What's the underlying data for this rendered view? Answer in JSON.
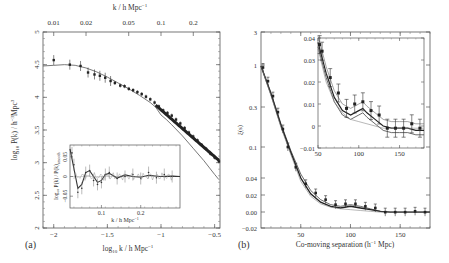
{
  "figure": {
    "panels": [
      {
        "id": "a",
        "label": "(a)",
        "xlabel": "log10 k / h Mpc^-1",
        "xlabel_main": "log",
        "xlabel_sub": "10",
        "xlabel_rest": " k / h Mpc",
        "xlabel_sup": "−1",
        "ylabel_main": "log",
        "ylabel_sub": "10",
        "ylabel_rest": " P(k) / h",
        "ylabel_sup": "−3",
        "ylabel_tail": "Mpc",
        "ylabel_sup2": "3",
        "top_axis_label": "k / h Mpc",
        "top_axis_sup": "−1",
        "top_ticks": [
          "0.01",
          "0.02",
          "0.05",
          "0.1",
          "0.2"
        ],
        "x_ticks": [
          "−2",
          "−1.5",
          "−1",
          "−0.5"
        ],
        "y_ticks": [
          "2",
          "2.5",
          "3",
          "3.5",
          "4",
          "4.5",
          "5"
        ],
        "inset": {
          "xlabel": "k / h Mpc",
          "xlabel_sup": "−1",
          "ylabel": "log10 P(k) / P(k)smooth",
          "ylabel_text": "log₁₀ P(k) / P(k)",
          "ylabel_sub": "smooth",
          "x_ticks": [
            "0.1",
            "0.2"
          ],
          "y_ticks": [
            "0.05",
            "0",
            "−0.05"
          ]
        }
      },
      {
        "id": "b",
        "label": "(b)",
        "xlabel": "Co-moving separation (h^-1 Mpc)",
        "xlabel_pre": "Co-moving separation (h",
        "xlabel_sup": "−1",
        "xlabel_post": " Mpc)",
        "ylabel": "ξ(s)",
        "x_ticks": [
          "50",
          "100",
          "150"
        ],
        "y_ticks": [
          "3",
          "1",
          "0.3",
          "0.1",
          "0.04",
          "0.02",
          "0.00",
          "−0.02"
        ],
        "inset": {
          "x_ticks": [
            "50",
            "100",
            "150"
          ],
          "y_ticks": [
            "0.04",
            "0.03",
            "0.02",
            "0.01",
            "0",
            "−0.01"
          ]
        }
      }
    ]
  },
  "chart_data": [
    {
      "type": "line",
      "title": "(a) Galaxy power spectrum",
      "xlabel": "log10 k / h Mpc^-1",
      "ylabel": "log10 P(k) / h^-3 Mpc^3",
      "xlim": [
        -2.1,
        -0.45
      ],
      "ylim": [
        2,
        5
      ],
      "top_axis": {
        "label": "k / h Mpc^-1",
        "ticks": [
          0.01,
          0.02,
          0.05,
          0.1,
          0.2
        ]
      },
      "series": [
        {
          "name": "data",
          "kind": "scatter_errorbars",
          "x": [
            -2.0,
            -1.85,
            -1.75,
            -1.68,
            -1.62,
            -1.57,
            -1.52,
            -1.47,
            -1.43,
            -1.38,
            -1.34,
            -1.3,
            -1.26,
            -1.22,
            -1.18,
            -1.14,
            -1.1,
            -1.06,
            -1.02,
            -0.98,
            -0.94,
            -0.9,
            -0.86,
            -0.82,
            -0.78,
            -0.74,
            -0.7,
            -0.66,
            -0.62,
            -0.58,
            -0.54,
            -0.5,
            -0.46
          ],
          "y": [
            4.57,
            4.5,
            4.48,
            4.38,
            4.35,
            4.33,
            4.3,
            4.25,
            4.22,
            4.18,
            4.17,
            4.13,
            4.11,
            4.08,
            4.05,
            4.01,
            3.97,
            3.92,
            3.86,
            3.8,
            3.76,
            3.72,
            3.66,
            3.6,
            3.53,
            3.46,
            3.4,
            3.34,
            3.27,
            3.21,
            3.14,
            3.08,
            3.02
          ]
        },
        {
          "name": "model (linear)",
          "kind": "line",
          "x": [
            -2.1,
            -2.0,
            -1.9,
            -1.8,
            -1.7,
            -1.6,
            -1.5,
            -1.4,
            -1.3,
            -1.2,
            -1.1,
            -1.05,
            -1.0,
            -0.95,
            -0.9,
            -0.8,
            -0.7,
            -0.6,
            -0.5,
            -0.46
          ],
          "y": [
            4.48,
            4.49,
            4.5,
            4.49,
            4.45,
            4.39,
            4.31,
            4.22,
            4.13,
            4.03,
            3.92,
            3.85,
            3.73,
            3.66,
            3.58,
            3.41,
            3.22,
            3.03,
            2.82,
            2.74
          ]
        }
      ],
      "inset": {
        "xlabel": "k / h Mpc^-1",
        "ylabel": "log10 P(k)/P(k)smooth",
        "xlim": [
          0.02,
          0.3
        ],
        "ylim": [
          -0.08,
          0.08
        ],
        "x_ticks": [
          0.1,
          0.2
        ],
        "y_ticks": [
          0.05,
          0,
          -0.05
        ],
        "series": [
          {
            "name": "oscillation data",
            "x": [
              0.025,
              0.03,
              0.04,
              0.05,
              0.06,
              0.07,
              0.08,
              0.09,
              0.1,
              0.11,
              0.12,
              0.14,
              0.16,
              0.18,
              0.2,
              0.22,
              0.24,
              0.26,
              0.28
            ],
            "y": [
              0.06,
              0.03,
              -0.04,
              -0.03,
              0.01,
              0.015,
              -0.01,
              -0.02,
              -0.015,
              0.005,
              0.01,
              -0.005,
              0.0,
              0.005,
              -0.005,
              0.01,
              -0.003,
              0.005,
              0.0
            ]
          },
          {
            "name": "model",
            "x": [
              0.02,
              0.03,
              0.04,
              0.05,
              0.06,
              0.07,
              0.08,
              0.09,
              0.1,
              0.11,
              0.12,
              0.14,
              0.16,
              0.18,
              0.2,
              0.22,
              0.25,
              0.28,
              0.3
            ],
            "y": [
              0.07,
              0.02,
              -0.03,
              -0.02,
              0.01,
              0.015,
              0.0,
              -0.015,
              -0.01,
              0.005,
              0.008,
              -0.004,
              0.004,
              0.0,
              -0.002,
              0.003,
              0.0,
              0.001,
              0.0
            ]
          }
        ]
      }
    },
    {
      "type": "line",
      "title": "(b) Correlation function",
      "xlabel": "Co-moving separation (h^-1 Mpc)",
      "ylabel": "ξ(s)",
      "xlim": [
        10,
        180
      ],
      "ylim": [
        -0.02,
        3
      ],
      "y_scale": "mixed (log above 0.04, linear below)",
      "series": [
        {
          "name": "data",
          "kind": "scatter_errorbars",
          "x": [
            12,
            17,
            22,
            27,
            32,
            37,
            45,
            55,
            65,
            75,
            85,
            95,
            105,
            115,
            125,
            135,
            145,
            155,
            165,
            175
          ],
          "y": [
            1.05,
            0.7,
            0.45,
            0.28,
            0.17,
            0.1,
            0.055,
            0.033,
            0.022,
            0.014,
            0.008,
            0.009,
            0.009,
            0.006,
            0.004,
            -0.001,
            -0.001,
            -0.001,
            0.0,
            -0.001
          ]
        },
        {
          "name": "model 1",
          "kind": "line",
          "x": [
            10,
            20,
            30,
            40,
            50,
            60,
            70,
            80,
            90,
            100,
            110,
            120,
            130,
            140,
            150,
            160,
            170,
            180
          ],
          "y": [
            1.1,
            0.5,
            0.2,
            0.09,
            0.045,
            0.025,
            0.014,
            0.008,
            0.006,
            0.008,
            0.006,
            0.003,
            0.0,
            -0.001,
            -0.001,
            -0.001,
            -0.001,
            -0.001
          ]
        },
        {
          "name": "model 2",
          "kind": "line",
          "x": [
            10,
            20,
            30,
            40,
            50,
            60,
            70,
            80,
            90,
            100,
            110,
            120,
            130,
            140,
            150,
            160,
            170,
            180
          ],
          "y": [
            1.1,
            0.48,
            0.19,
            0.085,
            0.04,
            0.021,
            0.011,
            0.006,
            0.004,
            0.006,
            0.004,
            0.002,
            0.0,
            -0.001,
            -0.001,
            -0.001,
            -0.001,
            -0.001
          ]
        },
        {
          "name": "model 3 (no BAO)",
          "kind": "line",
          "x": [
            10,
            20,
            30,
            40,
            50,
            60,
            70,
            80,
            90,
            100,
            110,
            120,
            130,
            140,
            150,
            160,
            170,
            180
          ],
          "y": [
            1.1,
            0.46,
            0.18,
            0.08,
            0.036,
            0.018,
            0.009,
            0.005,
            0.003,
            0.002,
            0.001,
            0.0,
            -0.001,
            -0.001,
            -0.001,
            -0.001,
            -0.001,
            -0.001
          ]
        }
      ],
      "inset": {
        "xlim": [
          50,
          180
        ],
        "ylim": [
          -0.01,
          0.04
        ],
        "x_ticks": [
          50,
          100,
          150
        ],
        "y_ticks": [
          0.04,
          0.03,
          0.02,
          0.01,
          0,
          -0.01
        ],
        "series": [
          {
            "name": "data",
            "x": [
              52,
              55,
              65,
              75,
              85,
              95,
              105,
              115,
              125,
              135,
              145,
              155,
              165,
              175
            ],
            "y": [
              0.037,
              0.034,
              0.022,
              0.015,
              0.008,
              0.01,
              0.011,
              0.007,
              0.005,
              -0.001,
              -0.001,
              -0.001,
              0.001,
              -0.001
            ]
          },
          {
            "name": "model BAO",
            "x": [
              50,
              60,
              70,
              80,
              90,
              100,
              105,
              110,
              120,
              130,
              140,
              150,
              160,
              170,
              180
            ],
            "y": [
              0.038,
              0.024,
              0.013,
              0.007,
              0.005,
              0.007,
              0.008,
              0.006,
              0.003,
              0.0,
              -0.001,
              -0.001,
              -0.001,
              -0.002,
              -0.002
            ]
          },
          {
            "name": "model no BAO",
            "x": [
              50,
              60,
              70,
              80,
              90,
              100,
              110,
              120,
              130,
              140,
              150,
              160,
              170,
              180
            ],
            "y": [
              0.035,
              0.02,
              0.011,
              0.006,
              0.003,
              0.002,
              0.001,
              0.0,
              -0.001,
              -0.001,
              -0.001,
              -0.001,
              -0.001,
              -0.001
            ]
          }
        ]
      }
    }
  ]
}
